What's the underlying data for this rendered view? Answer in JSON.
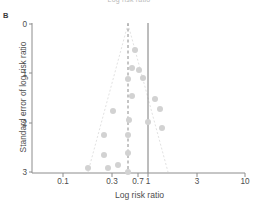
{
  "panel": {
    "label": "B"
  },
  "top_cropped_label": "Log risk ratio",
  "chart_data": {
    "type": "scatter",
    "title": "",
    "subtitle": "",
    "xlabel": "Log risk ratio",
    "ylabel": "Standard error of log risk ratio",
    "xscale": "log",
    "xlim": [
      0.07,
      10
    ],
    "ylim": [
      0,
      3
    ],
    "y_inverted": true,
    "grid": false,
    "legend": "none",
    "xticks": [
      {
        "value": 0.1,
        "label": "0.1",
        "px": 63
      },
      {
        "value": 0.3,
        "label": "0.3",
        "px": 112
      },
      {
        "value": 0.7,
        "label": "0.7",
        "px": 138
      },
      {
        "value": 1,
        "label": "1",
        "px": 148
      },
      {
        "value": 3,
        "label": "3",
        "px": 197
      },
      {
        "value": 10,
        "label": "10",
        "px": 245
      }
    ],
    "yticks": [
      {
        "value": 0,
        "label": "0",
        "px": 24
      },
      {
        "value": 1,
        "label": "1",
        "px": 73
      },
      {
        "value": 2,
        "label": "2",
        "px": 123
      },
      {
        "value": 3,
        "label": "3",
        "px": 172
      }
    ],
    "reference_lines": [
      {
        "name": "null-effect-line",
        "x": 1,
        "style": "solid",
        "color": "#7a7a7a",
        "px": 148
      },
      {
        "name": "pooled-estimate-line",
        "x": 0.5,
        "style": "dashed",
        "color": "#8a8a8a",
        "px": 128
      }
    ],
    "funnel_boundaries": {
      "style": "dashed",
      "color": "#e2e2e2",
      "apex": {
        "x": 0.5,
        "y": 0
      },
      "left_base": {
        "x": 0.16,
        "y": 3
      },
      "right_base": {
        "x": 0.78,
        "y": 3
      }
    },
    "marker": {
      "shape": "circle",
      "fill": "#d2d2d2",
      "size_px": 6
    },
    "points": [
      {
        "x": 0.62,
        "y": 0.3,
        "cx": 135,
        "cy": 50
      },
      {
        "x": 0.58,
        "y": 0.67,
        "cx": 132,
        "cy": 68
      },
      {
        "x": 0.7,
        "y": 0.72,
        "cx": 139,
        "cy": 70
      },
      {
        "x": 0.5,
        "y": 0.93,
        "cx": 128,
        "cy": 79
      },
      {
        "x": 0.78,
        "y": 0.9,
        "cx": 143,
        "cy": 78
      },
      {
        "x": 0.58,
        "y": 1.26,
        "cx": 132,
        "cy": 96
      },
      {
        "x": 1.22,
        "y": 1.32,
        "cx": 155,
        "cy": 99
      },
      {
        "x": 1.38,
        "y": 1.52,
        "cx": 160,
        "cy": 109
      },
      {
        "x": 0.32,
        "y": 1.56,
        "cx": 113,
        "cy": 111
      },
      {
        "x": 0.52,
        "y": 1.75,
        "cx": 129,
        "cy": 120
      },
      {
        "x": 1.0,
        "y": 1.78,
        "cx": 148,
        "cy": 122
      },
      {
        "x": 1.45,
        "y": 1.9,
        "cx": 162,
        "cy": 128
      },
      {
        "x": 0.24,
        "y": 2.05,
        "cx": 104,
        "cy": 135
      },
      {
        "x": 0.5,
        "y": 2.05,
        "cx": 128,
        "cy": 135
      },
      {
        "x": 0.24,
        "y": 2.45,
        "cx": 104,
        "cy": 155
      },
      {
        "x": 0.5,
        "y": 2.42,
        "cx": 128,
        "cy": 153
      },
      {
        "x": 0.16,
        "y": 2.72,
        "cx": 88,
        "cy": 168
      },
      {
        "x": 0.27,
        "y": 2.72,
        "cx": 108,
        "cy": 168
      },
      {
        "x": 0.37,
        "y": 2.66,
        "cx": 118,
        "cy": 165
      },
      {
        "x": 0.5,
        "y": 2.9,
        "cx": 128,
        "cy": 172
      }
    ]
  }
}
